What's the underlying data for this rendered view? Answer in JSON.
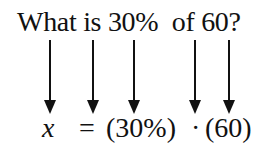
{
  "question": "What is 30%  of 60?",
  "equation": {
    "x": "x",
    "equals": "=",
    "percent": "(30%)",
    "dot": "·",
    "value": "(60)"
  },
  "arrows": [
    {
      "from": "What",
      "to": "x",
      "x": 44
    },
    {
      "from": "is",
      "to": "=",
      "x": 87
    },
    {
      "from": "30%",
      "to": "(30%)",
      "x": 128
    },
    {
      "from": "of",
      "to": "·",
      "x": 189
    },
    {
      "from": "60",
      "to": "(60)",
      "x": 223
    }
  ]
}
